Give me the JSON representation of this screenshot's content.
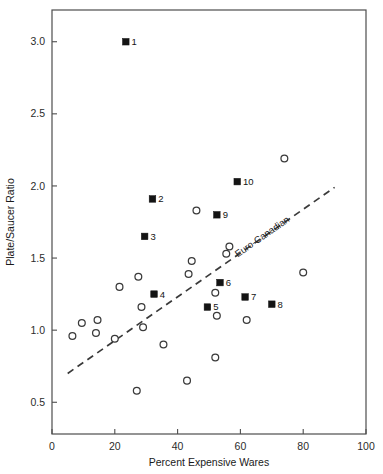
{
  "chart_data": {
    "type": "scatter",
    "title": "",
    "xlabel": "Percent Expensive Wares",
    "ylabel": "Plate/Saucer Ratio",
    "xlim": [
      0,
      100
    ],
    "ylim": [
      0.28,
      3.22
    ],
    "grid": false,
    "xticks": [
      0,
      20,
      40,
      60,
      80,
      100
    ],
    "xticklabels": [
      "0",
      "20",
      "40",
      "60",
      "80",
      "100"
    ],
    "yticks": [
      0.5,
      1.0,
      1.5,
      2.0,
      2.5,
      3.0
    ],
    "yticklabels": [
      "0.5",
      "1.0",
      "1.5",
      "2.0",
      "2.5",
      "3.0"
    ],
    "legend": [],
    "series": [
      {
        "name": "labeled-sites",
        "marker": "filled-square",
        "points": [
          {
            "label": "1",
            "x": 23.5,
            "y": 3.0
          },
          {
            "label": "2",
            "x": 32.0,
            "y": 1.91
          },
          {
            "label": "3",
            "x": 29.5,
            "y": 1.65
          },
          {
            "label": "4",
            "x": 32.5,
            "y": 1.25
          },
          {
            "label": "5",
            "x": 49.5,
            "y": 1.16
          },
          {
            "label": "6",
            "x": 53.5,
            "y": 1.33
          },
          {
            "label": "7",
            "x": 61.5,
            "y": 1.23
          },
          {
            "label": "8",
            "x": 70.0,
            "y": 1.18
          },
          {
            "label": "9",
            "x": 52.5,
            "y": 1.8
          },
          {
            "label": "10",
            "x": 59.0,
            "y": 2.03
          }
        ]
      },
      {
        "name": "unlabeled-sites",
        "marker": "open-circle",
        "points": [
          {
            "x": 6.5,
            "y": 0.96
          },
          {
            "x": 9.5,
            "y": 1.05
          },
          {
            "x": 14.5,
            "y": 1.07
          },
          {
            "x": 14.0,
            "y": 0.98
          },
          {
            "x": 20.0,
            "y": 0.94
          },
          {
            "x": 21.5,
            "y": 1.3
          },
          {
            "x": 27.5,
            "y": 1.37
          },
          {
            "x": 28.5,
            "y": 1.16
          },
          {
            "x": 29.0,
            "y": 1.02
          },
          {
            "x": 27.0,
            "y": 0.58
          },
          {
            "x": 35.5,
            "y": 0.9
          },
          {
            "x": 43.0,
            "y": 0.65
          },
          {
            "x": 43.5,
            "y": 1.39
          },
          {
            "x": 44.5,
            "y": 1.48
          },
          {
            "x": 46.0,
            "y": 1.83
          },
          {
            "x": 52.0,
            "y": 1.26
          },
          {
            "x": 52.5,
            "y": 1.1
          },
          {
            "x": 52.0,
            "y": 0.81
          },
          {
            "x": 55.5,
            "y": 1.53
          },
          {
            "x": 56.5,
            "y": 1.58
          },
          {
            "x": 62.0,
            "y": 1.07
          },
          {
            "x": 74.0,
            "y": 2.19
          },
          {
            "x": 80.0,
            "y": 1.4
          }
        ]
      }
    ],
    "annotations": [
      {
        "name": "euro-canadian-trend",
        "text": "Euro-Canadian",
        "type": "dashed-regression-line",
        "x_start": 5.0,
        "y_start": 0.7,
        "x_end": 90.0,
        "y_end": 1.99
      }
    ]
  }
}
